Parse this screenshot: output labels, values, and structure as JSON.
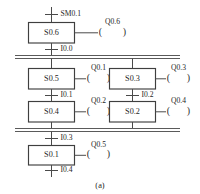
{
  "diagram": {
    "type": "sequential-function-chart",
    "caption": "(a)",
    "colors": {
      "line": "#4a4a4a",
      "box_stroke": "#3f3f3f",
      "box_fill": "#ffffff",
      "text": "#262626",
      "background": "#ffffff"
    },
    "states": [
      {
        "id": "s06",
        "label": "S0.6",
        "coil": "Q0.6"
      },
      {
        "id": "s05",
        "label": "S0.5",
        "coil": "Q0.1"
      },
      {
        "id": "s03",
        "label": "S0.3",
        "coil": "Q0.3"
      },
      {
        "id": "s04",
        "label": "S0.4",
        "coil": "Q0.2"
      },
      {
        "id": "s02",
        "label": "S0.2",
        "coil": "Q0.4"
      },
      {
        "id": "s01",
        "label": "S0.1",
        "coil": "Q0.5"
      }
    ],
    "transitions": [
      {
        "id": "t_sm01",
        "label": "SM0.1"
      },
      {
        "id": "t_i00",
        "label": "I0.0"
      },
      {
        "id": "t_i01",
        "label": "I0.1"
      },
      {
        "id": "t_i02",
        "label": "I0.2"
      },
      {
        "id": "t_i03",
        "label": "I0.3"
      },
      {
        "id": "t_i04",
        "label": "I0.4"
      }
    ],
    "coil_open_paren": "(",
    "coil_close_paren": ")"
  },
  "watermark": {
    "text": ""
  }
}
